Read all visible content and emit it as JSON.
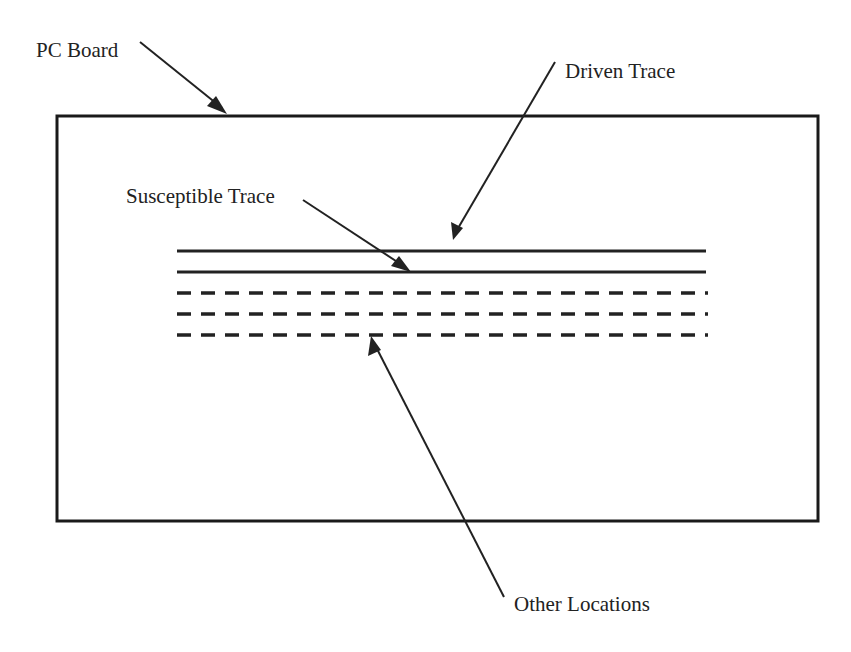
{
  "diagram": {
    "labels": {
      "pc_board": "PC Board",
      "driven_trace": "Driven Trace",
      "susceptible_trace": "Susceptible Trace",
      "other_locations": "Other Locations"
    },
    "board": {
      "x": 57,
      "y": 116,
      "width": 761,
      "height": 405
    },
    "traces": [
      {
        "name": "driven-trace",
        "style": "solid",
        "y": 251,
        "x1": 177,
        "x2": 706
      },
      {
        "name": "susceptible-trace",
        "style": "solid",
        "y": 272,
        "x1": 177,
        "x2": 706
      },
      {
        "name": "other-location-1",
        "style": "dashed",
        "y": 293,
        "x1": 177,
        "x2": 706
      },
      {
        "name": "other-location-2",
        "style": "dashed",
        "y": 314,
        "x1": 177,
        "x2": 706
      },
      {
        "name": "other-location-3",
        "style": "dashed",
        "y": 335,
        "x1": 177,
        "x2": 706
      }
    ],
    "colors": {
      "line": "#222222",
      "background": "#ffffff"
    }
  }
}
